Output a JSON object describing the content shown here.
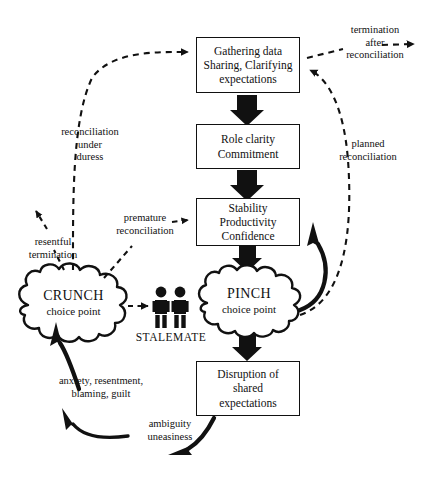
{
  "diagram": {
    "colors": {
      "ink": "#111111",
      "background": "#ffffff"
    },
    "boxes": [
      {
        "id": "gathering",
        "lines": [
          "Gathering data",
          "Sharing, Clarifying",
          "expectations"
        ]
      },
      {
        "id": "role-clarity",
        "lines": [
          "Role clarity",
          "Commitment"
        ]
      },
      {
        "id": "stability",
        "lines": [
          "Stability",
          "Productivity",
          "Confidence"
        ]
      },
      {
        "id": "disruption",
        "lines": [
          "Disruption of",
          "shared",
          "expectations"
        ]
      }
    ],
    "clouds": [
      {
        "id": "crunch",
        "title": "CRUNCH",
        "subtitle": "choice point"
      },
      {
        "id": "pinch",
        "title": "PINCH",
        "subtitle": "choice point"
      }
    ],
    "figures_label": "STALEMATE",
    "edge_labels": [
      {
        "id": "termination-after-reconciliation",
        "lines": [
          "termination",
          "after",
          "reconciliation"
        ]
      },
      {
        "id": "reconciliation-under-duress",
        "lines": [
          "reconciliation",
          "under",
          "duress"
        ]
      },
      {
        "id": "planned-reconciliation",
        "lines": [
          "planned",
          "reconciliation"
        ]
      },
      {
        "id": "premature-reconciliation",
        "lines": [
          "premature",
          "reconciliation"
        ]
      },
      {
        "id": "resentful-termination",
        "lines": [
          "resentful",
          "termination"
        ]
      },
      {
        "id": "anxiety-resentment",
        "lines": [
          "anxiety, resentment,",
          "blaming, guilt"
        ]
      },
      {
        "id": "ambiguity-uneasiness",
        "lines": [
          "ambiguity",
          "uneasiness"
        ]
      }
    ]
  }
}
